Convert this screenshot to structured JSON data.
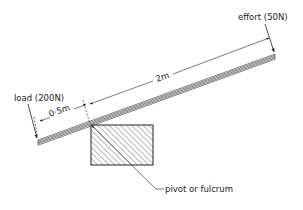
{
  "diagram": {
    "type": "lever-mechanics",
    "labels": {
      "load": "load (200N)",
      "effort": "effort (50N)",
      "short_distance": "0·5m",
      "long_distance": "2m",
      "pivot": "pivot or fulcrum"
    },
    "values": {
      "load_force_N": 200,
      "effort_force_N": 50,
      "load_arm_m": 0.5,
      "effort_arm_m": 2
    },
    "colors": {
      "ink": "#222222",
      "background": "#ffffff"
    }
  }
}
